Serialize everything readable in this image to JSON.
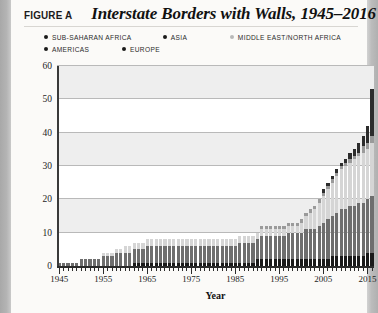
{
  "header": {
    "figure_label": "FIGURE A",
    "title": "Interstate Borders with Walls, 1945–2016"
  },
  "legend": {
    "rows": [
      [
        {
          "label": "SUB-SAHARAN AFRICA",
          "color": "#1a1a1a",
          "width_px": 124
        },
        {
          "label": "ASIA",
          "color": "#1a1a1a",
          "width_px": 70
        },
        {
          "label": "MIDDLE EAST/NORTH AFRICA",
          "color": "#b9b9b9",
          "width_px": 140
        }
      ],
      [
        {
          "label": "AMERICAS",
          "color": "#1a1a1a",
          "width_px": 78
        },
        {
          "label": "EUROPE",
          "color": "#1a1a1a",
          "width_px": 70
        }
      ]
    ]
  },
  "chart_data": {
    "type": "bar",
    "stacked": true,
    "title": "Interstate Borders with Walls, 1945–2016",
    "xlabel": "Year",
    "ylabel": "",
    "ylim": [
      0,
      60
    ],
    "yticks": [
      0,
      10,
      20,
      30,
      40,
      50,
      60
    ],
    "xlim": [
      1945,
      2016
    ],
    "xtick_labels": [
      1945,
      1955,
      1965,
      1975,
      1985,
      1995,
      2005,
      2015
    ],
    "grid": "horizontal",
    "banded_background": true,
    "band_ranges": [
      [
        10,
        20
      ],
      [
        30,
        40
      ],
      [
        50,
        60
      ]
    ],
    "legend_position": "top",
    "colors": {
      "sub_saharan_africa": "#1a1a1a",
      "asia": "#6e6e6e",
      "middle_east_north_africa": "#d5d5d5",
      "americas": "#9a9a9a",
      "europe": "#2c2c2c",
      "band": "#eeeeee",
      "gridline": "#b9b9b9",
      "axis": "#2b2b2b"
    },
    "x": [
      1945,
      1946,
      1947,
      1948,
      1949,
      1950,
      1951,
      1952,
      1953,
      1954,
      1955,
      1956,
      1957,
      1958,
      1959,
      1960,
      1961,
      1962,
      1963,
      1964,
      1965,
      1966,
      1967,
      1968,
      1969,
      1970,
      1971,
      1972,
      1973,
      1974,
      1975,
      1976,
      1977,
      1978,
      1979,
      1980,
      1981,
      1982,
      1983,
      1984,
      1985,
      1986,
      1987,
      1988,
      1989,
      1990,
      1991,
      1992,
      1993,
      1994,
      1995,
      1996,
      1997,
      1998,
      1999,
      2000,
      2001,
      2002,
      2003,
      2004,
      2005,
      2006,
      2007,
      2008,
      2009,
      2010,
      2011,
      2012,
      2013,
      2014,
      2015,
      2016
    ],
    "series": [
      {
        "name": "SUB-SAHARAN AFRICA",
        "color": "#1a1a1a",
        "values": [
          0,
          0,
          0,
          0,
          0,
          0,
          0,
          0,
          0,
          0,
          0,
          0,
          0,
          0,
          0,
          0,
          0,
          1,
          1,
          1,
          1,
          1,
          1,
          1,
          1,
          1,
          1,
          1,
          1,
          1,
          1,
          1,
          1,
          1,
          1,
          1,
          1,
          1,
          1,
          1,
          1,
          1,
          1,
          1,
          1,
          2,
          2,
          2,
          2,
          2,
          2,
          2,
          2,
          2,
          2,
          2,
          2,
          2,
          2,
          2,
          2,
          2,
          3,
          3,
          3,
          3,
          3,
          3,
          3,
          3,
          4,
          4
        ]
      },
      {
        "name": "ASIA",
        "color": "#6e6e6e",
        "values": [
          1,
          1,
          1,
          1,
          1,
          2,
          2,
          2,
          2,
          2,
          3,
          3,
          3,
          4,
          4,
          4,
          4,
          4,
          4,
          4,
          5,
          5,
          5,
          5,
          5,
          5,
          5,
          5,
          5,
          5,
          5,
          5,
          5,
          5,
          5,
          5,
          5,
          5,
          5,
          5,
          5,
          6,
          6,
          6,
          6,
          6,
          7,
          7,
          7,
          7,
          7,
          7,
          8,
          8,
          8,
          8,
          9,
          9,
          9,
          10,
          11,
          12,
          12,
          13,
          14,
          14,
          15,
          15,
          16,
          16,
          16,
          17
        ]
      },
      {
        "name": "MIDDLE EAST/NORTH AFRICA",
        "color": "#d5d5d5",
        "values": [
          0,
          0,
          0,
          0,
          0,
          0,
          0,
          0,
          0,
          0,
          1,
          1,
          1,
          1,
          1,
          2,
          2,
          2,
          2,
          2,
          2,
          2,
          2,
          2,
          2,
          2,
          2,
          2,
          2,
          2,
          2,
          2,
          2,
          2,
          2,
          2,
          2,
          2,
          2,
          2,
          2,
          2,
          2,
          2,
          2,
          2,
          2,
          2,
          2,
          2,
          2,
          2,
          2,
          2,
          2,
          3,
          4,
          5,
          6,
          7,
          8,
          9,
          10,
          11,
          12,
          13,
          13,
          14,
          14,
          15,
          15,
          16
        ]
      },
      {
        "name": "AMERICAS",
        "color": "#9a9a9a",
        "values": [
          0,
          0,
          0,
          0,
          0,
          0,
          0,
          0,
          0,
          0,
          0,
          0,
          0,
          0,
          0,
          0,
          0,
          0,
          0,
          0,
          0,
          0,
          0,
          0,
          0,
          0,
          0,
          0,
          0,
          0,
          0,
          0,
          0,
          0,
          0,
          0,
          0,
          0,
          0,
          0,
          0,
          0,
          0,
          0,
          0,
          0,
          1,
          1,
          1,
          1,
          1,
          1,
          1,
          1,
          1,
          1,
          1,
          1,
          1,
          1,
          1,
          1,
          1,
          1,
          1,
          1,
          1,
          1,
          1,
          2,
          2,
          2
        ]
      },
      {
        "name": "EUROPE",
        "color": "#2c2c2c",
        "values": [
          0,
          0,
          0,
          0,
          0,
          0,
          0,
          0,
          0,
          0,
          0,
          0,
          0,
          0,
          0,
          0,
          0,
          0,
          0,
          0,
          0,
          0,
          0,
          0,
          0,
          0,
          0,
          0,
          0,
          0,
          0,
          0,
          0,
          0,
          0,
          0,
          0,
          0,
          0,
          0,
          0,
          0,
          0,
          0,
          0,
          0,
          0,
          0,
          0,
          0,
          0,
          0,
          0,
          0,
          0,
          0,
          0,
          0,
          0,
          0,
          1,
          1,
          1,
          1,
          1,
          1,
          2,
          2,
          3,
          3,
          5,
          14
        ]
      }
    ],
    "totals": [
      1,
      1,
      1,
      1,
      1,
      2,
      2,
      2,
      2,
      2,
      4,
      4,
      4,
      5,
      5,
      6,
      6,
      7,
      7,
      7,
      8,
      8,
      8,
      8,
      8,
      8,
      8,
      8,
      8,
      8,
      8,
      8,
      8,
      8,
      8,
      8,
      8,
      8,
      8,
      8,
      8,
      9,
      9,
      9,
      9,
      10,
      12,
      12,
      12,
      12,
      12,
      12,
      13,
      13,
      13,
      14,
      16,
      17,
      18,
      20,
      23,
      25,
      27,
      29,
      31,
      33,
      34,
      35,
      37,
      39,
      42,
      53
    ]
  }
}
